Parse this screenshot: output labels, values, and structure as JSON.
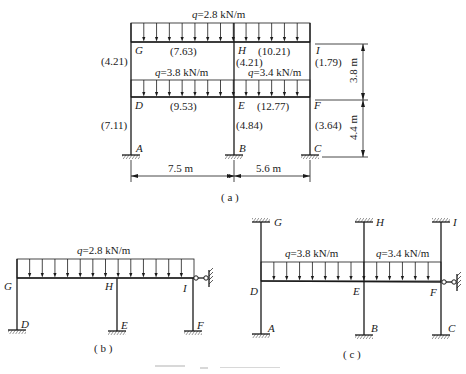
{
  "figure_a": {
    "caption": "( a )",
    "loads": [
      {
        "label": "q=2.8 kN/m",
        "q_symbol": "q",
        "q_value": "=2.8 kN/m",
        "span": "GI"
      },
      {
        "label": "q=3.8 kN/m",
        "q_symbol": "q",
        "q_value": "=3.8 kN/m",
        "span": "DE"
      },
      {
        "label": "q=3.4 kN/m",
        "q_symbol": "q",
        "q_value": "=3.4 kN/m",
        "span": "EF"
      }
    ],
    "nodes": {
      "G": "G",
      "H": "H",
      "I": "I",
      "D": "D",
      "E": "E",
      "F": "F",
      "A": "A",
      "B": "B",
      "C": "C"
    },
    "stiffness_values": {
      "GD": "(4.21)",
      "GH": "(7.63)",
      "HI": "(10.21)",
      "HE": "(4.21)",
      "IF": "(1.79)",
      "DE": "(9.53)",
      "EF": "(12.77)",
      "DA": "(7.11)",
      "EB": "(4.84)",
      "FC": "(3.64)"
    },
    "dimensions": {
      "span_1": "7.5 m",
      "span_2": "5.6 m",
      "storey_upper": "3.8 m",
      "storey_lower": "4.4 m"
    }
  },
  "figure_b": {
    "caption": "( b )",
    "load": {
      "q_symbol": "q",
      "q_value": "=2.8 kN/m"
    },
    "nodes": {
      "G": "G",
      "H": "H",
      "I": "I",
      "D": "D",
      "E": "E",
      "F": "F"
    }
  },
  "figure_c": {
    "caption": "( c )",
    "loads": [
      {
        "q_symbol": "q",
        "q_value": "=3.8 kN/m"
      },
      {
        "q_symbol": "q",
        "q_value": "=3.4 kN/m"
      }
    ],
    "nodes": {
      "G": "G",
      "H": "H",
      "I": "I",
      "D": "D",
      "E": "E",
      "F": "F",
      "A": "A",
      "B": "B",
      "C": "C"
    }
  }
}
